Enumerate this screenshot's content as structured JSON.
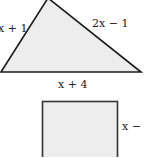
{
  "diagram": {
    "triangle": {
      "fill": "#ededed",
      "stroke": "#1a1a1a",
      "labels": {
        "left_side": "3x + 1",
        "right_side": "2x − 1",
        "base": "x + 4"
      }
    },
    "rectangle": {
      "fill": "#ededed",
      "stroke": "#333333",
      "labels": {
        "right_side": "x − 1"
      }
    }
  }
}
